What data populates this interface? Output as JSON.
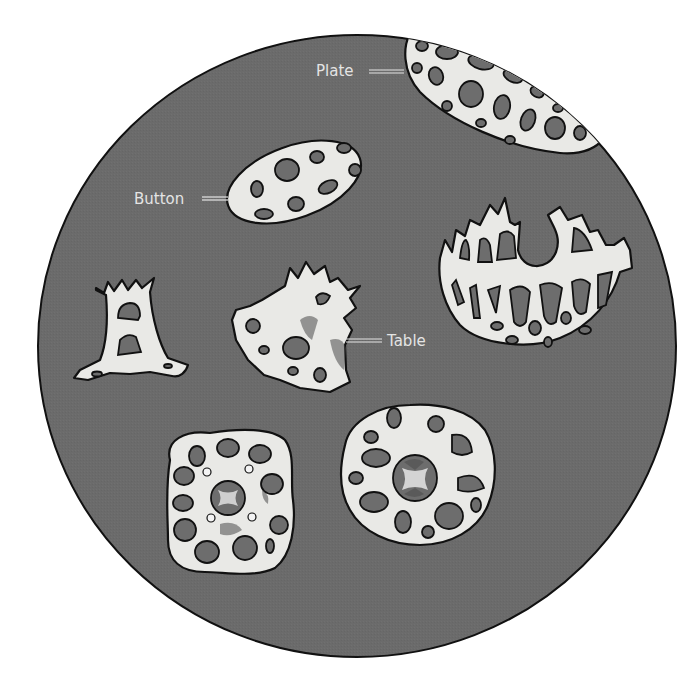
{
  "figure": {
    "background_color": "#ffffff",
    "field_color": "#6b6b6b",
    "ossicle_color": "#e9e9e6",
    "outline_color": "#111111",
    "label_color": "#e4e4e4"
  },
  "labels": {
    "plate": "Plate",
    "button": "Button",
    "table": "Table"
  },
  "ossicles": [
    {
      "id": "plate",
      "labeled": true,
      "label": "Plate"
    },
    {
      "id": "button",
      "labeled": true,
      "label": "Button"
    },
    {
      "id": "table",
      "labeled": true,
      "label": "Table"
    },
    {
      "id": "basket",
      "labeled": false
    },
    {
      "id": "anchor-rod",
      "labeled": false
    },
    {
      "id": "rosette-left",
      "labeled": false
    },
    {
      "id": "rosette-right",
      "labeled": false
    }
  ]
}
